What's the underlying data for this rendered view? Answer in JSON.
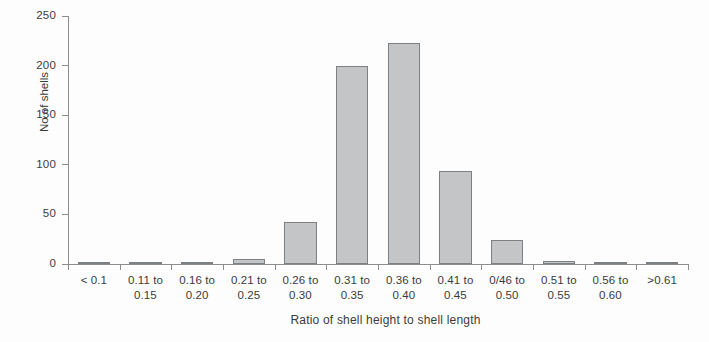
{
  "chart_data": {
    "type": "bar",
    "title": "",
    "xlabel": "Ratio of shell height to shell length",
    "ylabel": "No of shells",
    "ylim": [
      0,
      250
    ],
    "yticks": [
      0,
      50,
      100,
      150,
      200,
      250
    ],
    "grid": false,
    "legend": null,
    "categories": [
      "< 0.1",
      "0.11 to 0.15",
      "0.16 to 0.20",
      "0.21 to 0.25",
      "0.26 to 0.30",
      "0.31 to 0.35",
      "0.36 to 0.40",
      "0.41 to 0.45",
      "0/46 to 0.50",
      "0.51 to 0.55",
      "0.56 to 0.60",
      ">0.61"
    ],
    "category_label_lines": [
      [
        "< 0.1",
        ""
      ],
      [
        "0.11 to",
        "0.15"
      ],
      [
        "0.16 to",
        "0.20"
      ],
      [
        "0.21 to",
        "0.25"
      ],
      [
        "0.26 to",
        "0.30"
      ],
      [
        "0.31 to",
        "0.35"
      ],
      [
        "0.36 to",
        "0.40"
      ],
      [
        "0.41 to",
        "0.45"
      ],
      [
        "0/46 to",
        "0.50"
      ],
      [
        "0.51 to",
        "0.55"
      ],
      [
        "0.56 to",
        "0.60"
      ],
      [
        ">0.61",
        ""
      ]
    ],
    "values": [
      0,
      0,
      2,
      5,
      42,
      200,
      223,
      94,
      24,
      3,
      2,
      2
    ],
    "colors": {
      "bar_fill": "#c3c5c6",
      "bar_border": "#7e8183",
      "axis": "#8b8d8e",
      "text": "#3b3b3b",
      "background": "#fdfdfd"
    }
  }
}
